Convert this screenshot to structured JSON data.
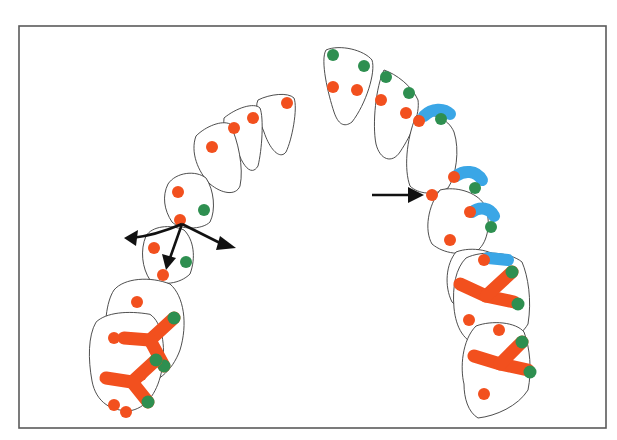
{
  "figure": {
    "type": "occlusal-contact-diagram",
    "colors": {
      "frame": "#5a5a5a",
      "tooth_outline": "#3a3a3a",
      "contact_red": "#f2501e",
      "contact_green": "#2e8f50",
      "contact_blue": "#3aa6e6",
      "arrow": "#111111"
    },
    "left_side": {
      "tooth_count": 7,
      "arrows": [
        "mesial",
        "buccal",
        "lingual"
      ]
    },
    "right_side": {
      "tooth_count": 7,
      "arrows": [
        "pointer"
      ]
    }
  }
}
